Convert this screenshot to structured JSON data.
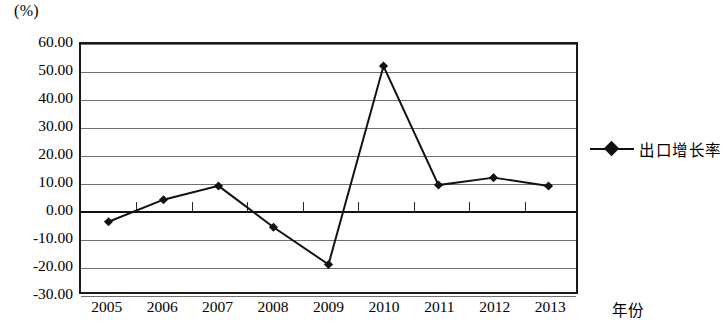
{
  "chart_data": {
    "type": "line",
    "title": "",
    "unit_label": "(%)",
    "xlabel": "年份",
    "ylabel": "",
    "categories": [
      "2005",
      "2006",
      "2007",
      "2008",
      "2009",
      "2010",
      "2011",
      "2012",
      "2013"
    ],
    "series": [
      {
        "name": "出口增长率",
        "values": [
          -4.5,
          3.5,
          8.5,
          -6.5,
          -20.0,
          52.0,
          8.8,
          11.5,
          8.5
        ],
        "color": "#111111",
        "marker": "diamond"
      }
    ],
    "ylim": [
      -30,
      60
    ],
    "ytick_values": [
      60,
      50,
      40,
      30,
      20,
      10,
      0,
      -10,
      -20,
      -30
    ],
    "ytick_labels": [
      "60.00",
      "50.00",
      "40.00",
      "30.00",
      "20.00",
      "10.00",
      "0.00",
      "-10.00",
      "-20.00",
      "-30.00"
    ],
    "grid": "horizontal",
    "legend_position": "right",
    "legend_entries": [
      "出口增长率"
    ]
  }
}
